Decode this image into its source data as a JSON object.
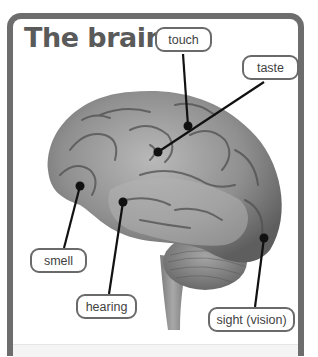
{
  "title": "The brain",
  "labels": {
    "touch": "touch",
    "taste": "taste",
    "smell": "smell",
    "hearing": "hearing",
    "sight": "sight (vision)"
  },
  "colors": {
    "frame": "#6d6d6d",
    "title": "#5a5a5a",
    "leader_line": "#111111"
  },
  "image": {
    "subject": "brain-photo",
    "description": "Side view of a human brain with cerebellum and brain stem, grayscale"
  }
}
